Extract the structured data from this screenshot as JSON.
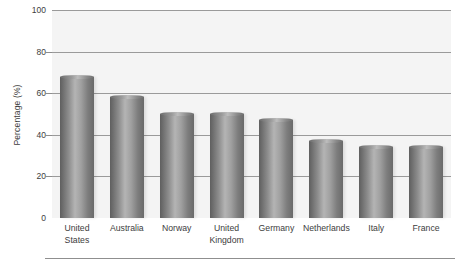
{
  "chart_data": {
    "type": "bar",
    "title": "",
    "subtitle": "",
    "xlabel": "",
    "ylabel": "Percentage (%)",
    "categories": [
      "United States",
      "Australia",
      "Norway",
      "United Kingdom",
      "Germany",
      "Netherlands",
      "Italy",
      "France"
    ],
    "category_lines": [
      [
        "United",
        "States"
      ],
      [
        "Australia"
      ],
      [
        "Norway"
      ],
      [
        "United",
        "Kingdom"
      ],
      [
        "Germany"
      ],
      [
        "Netherlands"
      ],
      [
        "Italy"
      ],
      [
        "France"
      ]
    ],
    "values": [
      68,
      58,
      50,
      50,
      47,
      37,
      34,
      34
    ],
    "ylim": [
      0,
      100
    ],
    "yticks": [
      0,
      20,
      40,
      60,
      80,
      100
    ],
    "ytick_labels": [
      "0",
      "20",
      "40",
      "60",
      "80",
      "100"
    ],
    "grid": true,
    "legend": null,
    "legend_position": "none",
    "series": [
      {
        "name": "Percentage",
        "values": [
          68,
          58,
          50,
          50,
          47,
          37,
          34,
          34
        ]
      }
    ]
  },
  "style": {
    "plot_background": "#f4f4f4",
    "gridline_color": "#9a9a9a",
    "bar_color_dark": "#5f5f5f",
    "bar_color_light": "#b4b4b4",
    "text_color": "#3d3d3d",
    "rule_color": "#8f8f8f"
  }
}
